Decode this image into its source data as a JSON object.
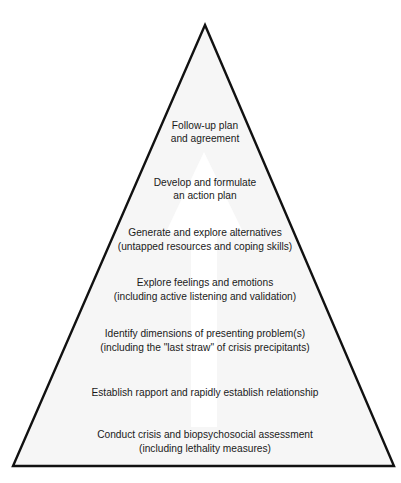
{
  "diagram": {
    "type": "pyramid-with-upward-arrow",
    "colors": {
      "outline": "#111111",
      "fill_top": "#a3a3a3",
      "fill_bottom": "#f6f6f6",
      "arrow": "#ffffff",
      "text": "#1a1a1a"
    },
    "stages": [
      {
        "order": 7,
        "lines": [
          "Follow-up plan",
          "and agreement"
        ]
      },
      {
        "order": 6,
        "lines": [
          "Develop and formulate",
          "an action plan"
        ]
      },
      {
        "order": 5,
        "lines": [
          "Generate and explore alternatives",
          "(untapped resources and coping skills)"
        ]
      },
      {
        "order": 4,
        "lines": [
          "Explore feelings and emotions",
          "(including active listening and validation)"
        ]
      },
      {
        "order": 3,
        "lines": [
          "Identify dimensions of presenting problem(s)",
          "(including the \"last straw\" of crisis precipitants)"
        ]
      },
      {
        "order": 2,
        "lines": [
          "Establish rapport and rapidly establish relationship"
        ]
      },
      {
        "order": 1,
        "lines": [
          "Conduct crisis and biopsychosocial assessment",
          "(including lethality measures)"
        ]
      }
    ]
  }
}
